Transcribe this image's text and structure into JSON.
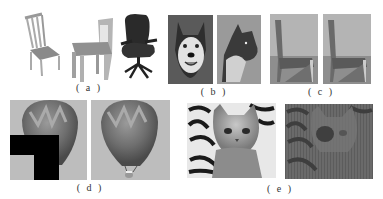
{
  "figure": {
    "panels": [
      {
        "id": "a",
        "label": "( a )",
        "description": "three chairs: wooden spindle-back chair, simple wooden chair, black office chair"
      },
      {
        "id": "b",
        "label": "( b )",
        "description": "husky dog face and wolf photo"
      },
      {
        "id": "c",
        "label": "( c )",
        "description": "two nearly identical chair photos"
      },
      {
        "id": "d",
        "label": "( d )",
        "description": "hot air balloon with black L-shaped occlusion mask and restored balloon"
      },
      {
        "id": "e",
        "label": "( e )",
        "description": "kitten photo and its degraded/noisy version"
      }
    ]
  },
  "colors": {
    "background": "#ffffff",
    "panel_gray": "#b8b8b8",
    "mask": "#000000",
    "label": "#333333"
  }
}
